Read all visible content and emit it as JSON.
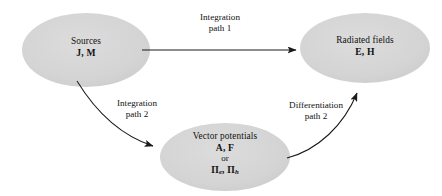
{
  "diagram": {
    "background_color": "#ffffff",
    "node_fill_color": "#d4d4d4",
    "line_color": "#1a1a1a",
    "nodes": [
      {
        "id": "sources",
        "title": "Sources",
        "symbols": "J, M",
        "cx": 86,
        "cy": 50,
        "rx": 64,
        "ry": 37
      },
      {
        "id": "radiated-fields",
        "title": "Radiated fields",
        "symbols": "E, H",
        "cx": 365,
        "cy": 48,
        "rx": 65,
        "ry": 35
      },
      {
        "id": "vector-potentials",
        "title": "Vector potentials",
        "symbols": "A, F",
        "connector": "or",
        "symbols_alt_1": "Π",
        "symbols_alt_1_sub": "e",
        "symbols_alt_sep": ", ",
        "symbols_alt_2": "Π",
        "symbols_alt_2_sub": "h",
        "cx": 225,
        "cy": 157,
        "rx": 65,
        "ry": 34
      }
    ],
    "edges": [
      {
        "id": "integration-path-1",
        "line_1": "Integration",
        "line_2": "path 1",
        "from": "sources",
        "to": "radiated-fields",
        "style": "straight"
      },
      {
        "id": "integration-path-2",
        "line_1": "Integration",
        "line_2": "path 2",
        "from": "sources",
        "to": "vector-potentials",
        "style": "curved"
      },
      {
        "id": "differentiation-path-2",
        "line_1": "Differentiation",
        "line_2": "path 2",
        "from": "vector-potentials",
        "to": "radiated-fields",
        "style": "curved"
      }
    ]
  }
}
